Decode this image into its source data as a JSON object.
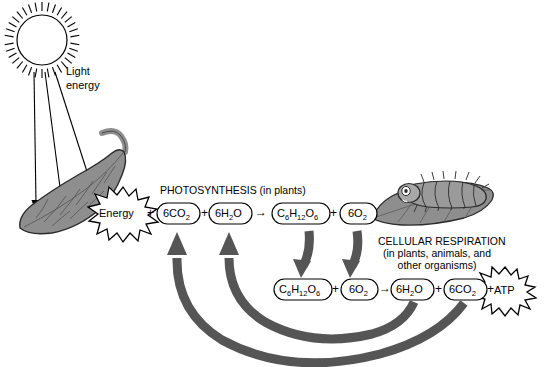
{
  "figure": {
    "domain_note": "textbook biology diagram",
    "background_color": "#ffffff",
    "ink_color": "#000000",
    "fill_gray": "#8e8e8e",
    "arrow_gray": "#555555",
    "leaf_outline": "#2b2b2b"
  },
  "sun": {
    "icon": "sun-icon",
    "ray_count": 34
  },
  "light": {
    "label_line1": "Light",
    "label_line2": "energy",
    "arrow_count": 3
  },
  "photosynthesis": {
    "title": "PHOTOSYNTHESIS (in plants)",
    "energy_burst_label": "Energy",
    "equation": {
      "reactants": [
        {
          "html": "6CO<sub>2</sub>",
          "text": "6CO2"
        },
        {
          "html": "6H<sub>2</sub>O",
          "text": "6H2O"
        }
      ],
      "products": [
        {
          "html": "C<sub>6</sub>H<sub>12</sub>O<sub>6</sub>",
          "text": "C6H12O6"
        },
        {
          "html": "6O<sub>2</sub>",
          "text": "6O2"
        }
      ],
      "plus": "+",
      "yields": "→"
    }
  },
  "cellular_respiration": {
    "title_line1": "CELLULAR RESPIRATION",
    "title_line2": "(in plants, animals, and",
    "title_line3": "other organisms)",
    "atp_burst_label": "ATP",
    "equation": {
      "reactants": [
        {
          "html": "C<sub>6</sub>H<sub>12</sub>O<sub>6</sub>",
          "text": "C6H12O6"
        },
        {
          "html": "6O<sub>2</sub>",
          "text": "6O2"
        }
      ],
      "products": [
        {
          "html": "6H<sub>2</sub>O",
          "text": "6H2O"
        },
        {
          "html": "6CO<sub>2</sub>",
          "text": "6CO2"
        }
      ],
      "plus": "+",
      "yields": "→"
    }
  },
  "organisms": {
    "leaf_left": "leaf-icon",
    "leaf_right": "leaf-icon",
    "caterpillar": "caterpillar-icon"
  },
  "flow": {
    "down_arrows_count": 2,
    "up_arrows_count": 2,
    "return_arcs_count": 2,
    "description_down": "glucose and oxygen from photosynthesis feed cellular respiration",
    "description_up": "water and carbon dioxide from respiration return to photosynthesis"
  }
}
